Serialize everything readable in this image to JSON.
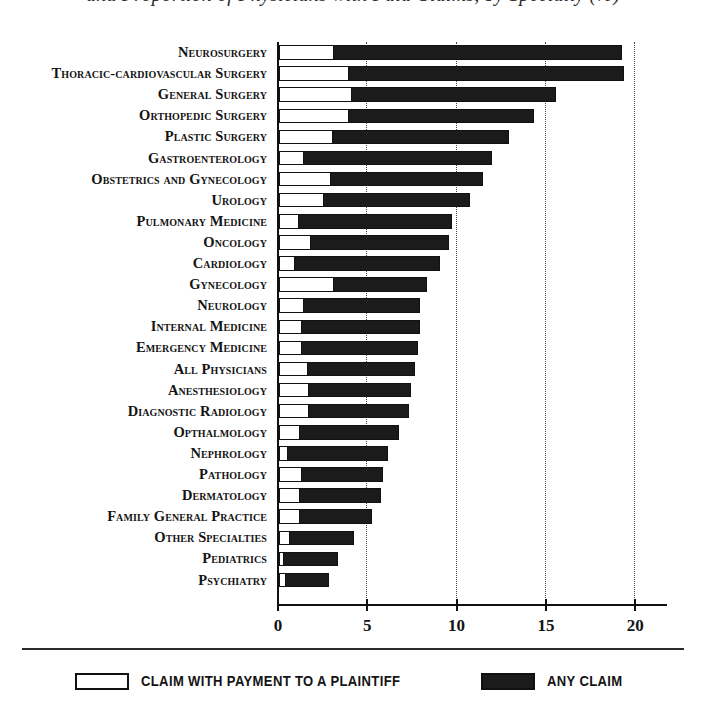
{
  "title": {
    "cropped_text": "and Proportion of Physicians with Paid Claims, by Specialty (%)"
  },
  "legend": {
    "position": "bottom",
    "items": [
      {
        "label": "CLAIM WITH PAYMENT TO A PLAINTIFF",
        "swatch": "open",
        "color": "#ffffff"
      },
      {
        "label": "ANY CLAIM",
        "swatch": "filled",
        "color": "#1b1b1b"
      }
    ]
  },
  "axis": {
    "xticks": [
      0,
      5,
      10,
      15,
      20
    ],
    "xtick_labels": [
      "0",
      "5",
      "10",
      "15",
      "20"
    ],
    "xlim": [
      0,
      21.8
    ],
    "grid": "vertical dotted at 5, 10, 15, 20"
  },
  "chart_data": {
    "type": "bar",
    "orientation": "horizontal",
    "title": "and Proportion of Physicians with Paid Claims, by Specialty (%)",
    "xlabel": "",
    "ylabel": "",
    "xlim": [
      0,
      21.8
    ],
    "grid": true,
    "legend_position": "bottom",
    "categories": [
      "Neurosurgery",
      "Thoracic-cardiovascular Surgery",
      "General Surgery",
      "Orthopedic Surgery",
      "Plastic Surgery",
      "Gastroenterology",
      "Obstetrics and Gynecology",
      "Urology",
      "Pulmonary Medicine",
      "Oncology",
      "Cardiology",
      "Gynecology",
      "Neurology",
      "Internal Medicine",
      "Emergency Medicine",
      "All Physicians",
      "Anesthesiology",
      "Diagnostic Radiology",
      "Opthalmology",
      "Nephrology",
      "Pathology",
      "Dermatology",
      "Family General Practice",
      "Other Specialties",
      "Pediatrics",
      "Psychiatry"
    ],
    "series": [
      {
        "name": "ANY CLAIM",
        "color": "#1b1b1b",
        "values": [
          19.2,
          19.3,
          15.5,
          14.3,
          12.9,
          11.9,
          11.4,
          10.7,
          9.7,
          9.5,
          9.0,
          8.3,
          7.9,
          7.9,
          7.8,
          7.6,
          7.4,
          7.3,
          6.7,
          6.1,
          5.8,
          5.7,
          5.2,
          4.2,
          3.3,
          2.8
        ]
      },
      {
        "name": "CLAIM WITH PAYMENT TO A PLAINTIFF",
        "color": "#ffffff",
        "values": [
          3.1,
          3.9,
          4.1,
          3.9,
          3.0,
          1.4,
          2.9,
          2.5,
          1.1,
          1.8,
          0.9,
          3.1,
          1.4,
          1.3,
          1.3,
          1.6,
          1.7,
          1.7,
          1.2,
          0.5,
          1.3,
          1.2,
          1.2,
          0.6,
          0.3,
          0.4
        ]
      }
    ]
  }
}
